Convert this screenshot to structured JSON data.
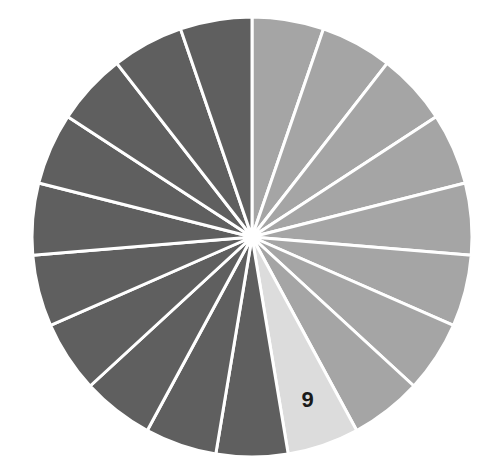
{
  "chart_data": {
    "type": "pie",
    "title": "",
    "slice_count": 19,
    "values": [
      1,
      1,
      1,
      1,
      1,
      1,
      1,
      1,
      1,
      1,
      1,
      1,
      1,
      1,
      1,
      1,
      1,
      1,
      1
    ],
    "slice_groups": [
      {
        "name": "medium",
        "slice_indices": [
          1,
          2,
          3,
          4,
          5,
          6,
          7,
          8
        ],
        "color": "#a5a5a5"
      },
      {
        "name": "highlighted",
        "slice_indices": [
          9
        ],
        "color": "#dcdcdc"
      },
      {
        "name": "dark",
        "slice_indices": [
          10,
          11,
          12,
          13,
          14,
          15,
          16,
          17,
          18,
          19
        ],
        "color": "#5f5f5f"
      }
    ],
    "start_angle_deg": 0,
    "direction": "clockwise",
    "separator_color": "#ffffff",
    "annotations": [
      {
        "slice_index": 9,
        "text": "9"
      }
    ],
    "legend": null
  },
  "colors": {
    "medium": "#a5a5a5",
    "highlight": "#dcdcdc",
    "dark": "#5f5f5f",
    "separator": "#ffffff",
    "label": "#1a1a1a"
  },
  "highlight_label": "9"
}
